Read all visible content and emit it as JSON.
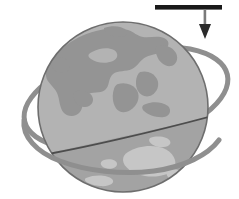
{
  "figure": {
    "name": "rotating-globe-with-orbit-ring-and-force-arrow",
    "title": "Earth globe with tilted orbital ring and downward force arrow",
    "width": 239,
    "height": 199,
    "background_color": "#ffffff"
  },
  "globe": {
    "name": "earth-globe",
    "center_x": 123,
    "center_y": 107,
    "radius": 85,
    "ocean_color": "#b3b3b3",
    "ocean_lower_color": "#a2a2a2",
    "land_color": "#949494",
    "land_light_color": "#c6c6c6",
    "outline_color": "#6e6e6e",
    "outline_width": 1.6,
    "label": "globe"
  },
  "equator_line": {
    "name": "tilted-equator-line",
    "color": "#4d4d4d",
    "width": 1.6,
    "start_x": 45,
    "start_y": 154,
    "end_x": 206,
    "end_y": 118,
    "label": "tilted plane line"
  },
  "ring": {
    "name": "orbit-ring",
    "color": "#8f8f8f",
    "width": 5.0,
    "center_x": 126,
    "center_y": 98,
    "rx": 104,
    "ry": 47,
    "rotation_deg": -13,
    "label": "orbit ring"
  },
  "arrow": {
    "name": "force-arrow",
    "bar_color": "#1a1a1a",
    "shaft_color": "#7a7a7a",
    "head_color": "#2b2b2b",
    "bar_x1": 155,
    "bar_x2": 222,
    "bar_y": 7,
    "bar_thickness": 4.5,
    "shaft_x": 205,
    "shaft_top_y": 9,
    "shaft_bottom_y": 24,
    "head_tip_y": 39,
    "head_half_width": 6,
    "label": "applied force"
  },
  "landmasses": [
    {
      "name": "eurasia",
      "label": "Eurasia"
    },
    {
      "name": "southeast-asia",
      "label": "Southeast Asia"
    },
    {
      "name": "australia",
      "label": "Australia"
    },
    {
      "name": "arctic-cap",
      "label": "Arctic region"
    }
  ]
}
